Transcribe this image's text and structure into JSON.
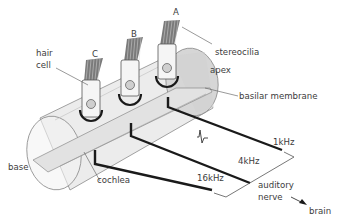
{
  "diagram": {
    "hair_cells": [
      {
        "id": "A",
        "label": "A"
      },
      {
        "id": "B",
        "label": "B"
      },
      {
        "id": "C",
        "label": "C"
      }
    ],
    "labels": {
      "hair_cell_line1": "hair",
      "hair_cell_line2": "cell",
      "stereocilia": "stereocilia",
      "apex": "apex",
      "basilar_membrane": "basilar membrane",
      "base": "base",
      "cochlea": "cochlea",
      "auditory_nerve_line1": "auditory",
      "auditory_nerve_line2": "nerve",
      "brain": "brain"
    },
    "frequencies": [
      {
        "label": "1kHz",
        "from": "A"
      },
      {
        "label": "4kHz",
        "from": "B"
      },
      {
        "label": "16kHz",
        "from": "C"
      }
    ],
    "colors": {
      "cylinder_fill": "#e9e9e9",
      "end_fill": "#d4d4d4",
      "nerve": "#1a1a1a",
      "text": "#3c3c3c"
    }
  }
}
